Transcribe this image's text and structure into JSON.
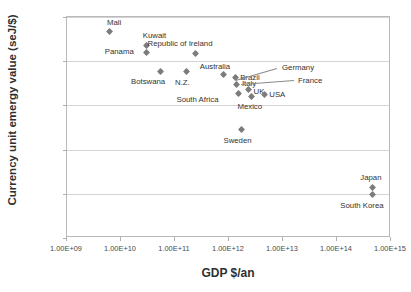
{
  "chart_data": {
    "type": "scatter",
    "title": "",
    "xlabel": "GDP $/an",
    "ylabel": "Currency unit emergy value (seJ/$)",
    "xscale": "log",
    "yscale": "log",
    "xlim": [
      1000000000.0,
      1000000000000000.0
    ],
    "ylim": [
      1000000000.0,
      100000000000000.0
    ],
    "grid": true,
    "legend": "none",
    "xticklabels": [
      "1.00E+09",
      "1.00E+10",
      "1.00E+11",
      "1.00E+12",
      "1.00E+13",
      "1.00E+14",
      "1.00E+15"
    ],
    "yticklabels": [
      "1.00E+09",
      "1.00E+10",
      "1.00E+11",
      "1.00E+12",
      "1.00E+13",
      "1.00E+14"
    ],
    "points": [
      {
        "label": "Mali",
        "x": 6000000000.0,
        "y": 46000000000000.0,
        "lx": -2,
        "ly": -13,
        "align": "left"
      },
      {
        "label": "Kuwait",
        "x": 30000000000.0,
        "y": 23000000000000.0,
        "lx": -4,
        "ly": -13,
        "align": "left"
      },
      {
        "label": "Panama",
        "x": 30000000000.0,
        "y": 16000000000000.0,
        "lx": -42,
        "ly": -4,
        "align": "left"
      },
      {
        "label": "Botswana",
        "x": 55000000000.0,
        "y": 5800000000000.0,
        "lx": -30,
        "ly": 6,
        "align": "left"
      },
      {
        "label": "Republic of Ireland",
        "x": 240000000000.0,
        "y": 15000000000000.0,
        "lx": -48,
        "ly": -13,
        "align": "left"
      },
      {
        "label": "N.Z.",
        "x": 160000000000.0,
        "y": 5800000000000.0,
        "lx": -11,
        "ly": 7,
        "align": "left"
      },
      {
        "label": "Australia",
        "x": 800000000000.0,
        "y": 5000000000000.0,
        "lx": -24,
        "ly": -12,
        "align": "left"
      },
      {
        "label": "Brazil",
        "x": 1300000000000.0,
        "y": 4200000000000.0,
        "lx": 5,
        "ly": -4,
        "align": "left"
      },
      {
        "label": "Italy",
        "x": 1400000000000.0,
        "y": 3000000000000.0,
        "lx": 5,
        "ly": -4,
        "align": "left"
      },
      {
        "label": "South Africa",
        "x": 1500000000000.0,
        "y": 1900000000000.0,
        "lx": -62,
        "ly": 3,
        "align": "left"
      },
      {
        "label": "UK",
        "x": 2300000000000.0,
        "y": 2300000000000.0,
        "lx": 5,
        "ly": -1,
        "align": "left"
      },
      {
        "label": "Mexico",
        "x": 2600000000000.0,
        "y": 1600000000000.0,
        "lx": -14,
        "ly": 7,
        "align": "left"
      },
      {
        "label": "USA",
        "x": 4500000000000.0,
        "y": 1800000000000.0,
        "lx": 5,
        "ly": -3,
        "align": "left"
      },
      {
        "label": "Sweden",
        "x": 1700000000000.0,
        "y": 280000000000.0,
        "lx": -18,
        "ly": 7,
        "align": "left"
      },
      {
        "label": "Japan",
        "x": 450000000000000.0,
        "y": 14000000000.0,
        "lx": -12,
        "ly": -13,
        "align": "left"
      },
      {
        "label": "South Korea",
        "x": 450000000000000.0,
        "y": 9500000000.0,
        "lx": -32,
        "ly": 7,
        "align": "left"
      }
    ],
    "callouts": [
      {
        "label": "Germany",
        "label_x": 281,
        "label_y": 63,
        "line_x1": 276,
        "line_y1": 68,
        "line_x2": 235,
        "line_y2": 80
      },
      {
        "label": "France",
        "label_x": 297,
        "label_y": 76,
        "line_x1": 293,
        "line_y1": 80,
        "line_x2": 240,
        "line_y2": 84
      }
    ]
  }
}
